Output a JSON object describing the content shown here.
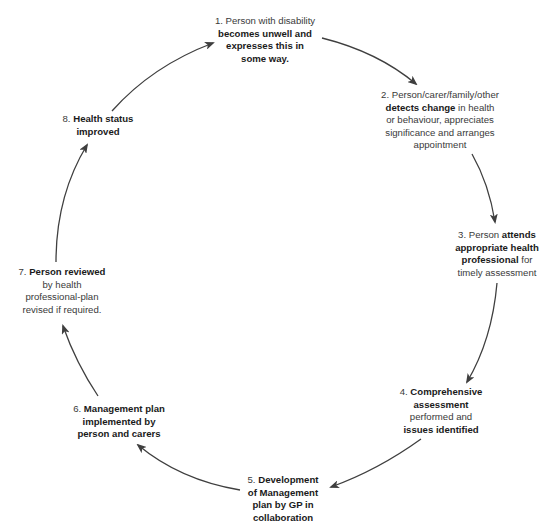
{
  "diagram": {
    "type": "cycle",
    "colors": {
      "text": "#333333",
      "bold_text": "#1a1a1a",
      "arrow": "#3f3f3f",
      "background": "#ffffff"
    },
    "nodes": [
      {
        "id": 1,
        "lines": [
          [
            {
              "t": "1. Person with disability",
              "b": false
            }
          ],
          [
            {
              "t": "becomes unwell and",
              "b": true
            }
          ],
          [
            {
              "t": "expresses this in",
              "b": true
            }
          ],
          [
            {
              "t": "some way.",
              "b": true
            }
          ]
        ]
      },
      {
        "id": 2,
        "lines": [
          [
            {
              "t": "2. Person/carer/family/other",
              "b": false
            }
          ],
          [
            {
              "t": "detects change",
              "b": true
            },
            {
              "t": " in health",
              "b": false
            }
          ],
          [
            {
              "t": "or behaviour, appreciates",
              "b": false
            }
          ],
          [
            {
              "t": "significance and arranges",
              "b": false
            }
          ],
          [
            {
              "t": "appointment",
              "b": false
            }
          ]
        ]
      },
      {
        "id": 3,
        "lines": [
          [
            {
              "t": "3. Person ",
              "b": false
            },
            {
              "t": "attends",
              "b": true
            }
          ],
          [
            {
              "t": "appropriate health",
              "b": true
            }
          ],
          [
            {
              "t": "professional",
              "b": true
            },
            {
              "t": " for",
              "b": false
            }
          ],
          [
            {
              "t": "timely assessment",
              "b": false
            }
          ]
        ]
      },
      {
        "id": 4,
        "lines": [
          [
            {
              "t": "4. ",
              "b": false
            },
            {
              "t": "Comprehensive",
              "b": true
            }
          ],
          [
            {
              "t": "assessment",
              "b": true
            }
          ],
          [
            {
              "t": "performed and",
              "b": false
            }
          ],
          [
            {
              "t": "issues identified",
              "b": true
            }
          ]
        ]
      },
      {
        "id": 5,
        "lines": [
          [
            {
              "t": "5. ",
              "b": false
            },
            {
              "t": "Development",
              "b": true
            }
          ],
          [
            {
              "t": "of Management",
              "b": true
            }
          ],
          [
            {
              "t": "plan by GP in",
              "b": true
            }
          ],
          [
            {
              "t": "collaboration",
              "b": true
            }
          ]
        ]
      },
      {
        "id": 6,
        "lines": [
          [
            {
              "t": "6. ",
              "b": false
            },
            {
              "t": "Management plan",
              "b": true
            }
          ],
          [
            {
              "t": "implemented by",
              "b": true
            }
          ],
          [
            {
              "t": "person and carers",
              "b": true
            }
          ]
        ]
      },
      {
        "id": 7,
        "lines": [
          [
            {
              "t": "7. ",
              "b": false
            },
            {
              "t": "Person reviewed",
              "b": true
            }
          ],
          [
            {
              "t": "by health",
              "b": false
            }
          ],
          [
            {
              "t": "professional-plan",
              "b": false
            }
          ],
          [
            {
              "t": "revised if required.",
              "b": false
            }
          ]
        ]
      },
      {
        "id": 8,
        "lines": [
          [
            {
              "t": "8.  ",
              "b": false
            },
            {
              "t": "Health status",
              "b": true
            }
          ],
          [
            {
              "t": "improved",
              "b": true
            }
          ]
        ]
      }
    ],
    "edges": [
      {
        "from": 1,
        "to": 2
      },
      {
        "from": 2,
        "to": 3
      },
      {
        "from": 3,
        "to": 4
      },
      {
        "from": 4,
        "to": 5
      },
      {
        "from": 5,
        "to": 6
      },
      {
        "from": 6,
        "to": 7
      },
      {
        "from": 7,
        "to": 8
      },
      {
        "from": 8,
        "to": 1
      }
    ]
  }
}
